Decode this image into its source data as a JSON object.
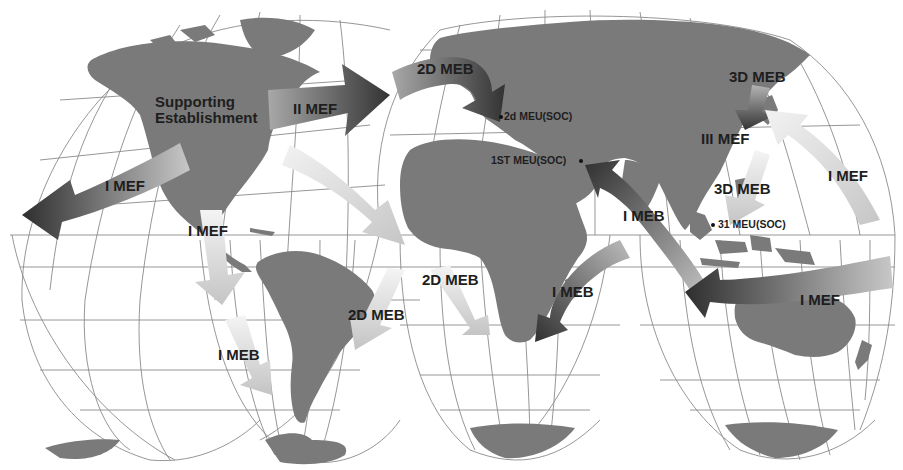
{
  "map": {
    "projection": "Goode homolosine (interrupted)",
    "colors": {
      "background": "#ffffff",
      "land": "#7a7a7a",
      "graticule": "#8a8a8a",
      "arrow_dark": "#3a3a3a",
      "arrow_mid": "#8c8c8c",
      "arrow_light": "#d8d8d8",
      "text": "#1e1e1e"
    },
    "labels": {
      "supporting_line1": "Supporting",
      "supporting_line2": "Establishment",
      "ii_mef": "II MEF",
      "i_mef_west": "I MEF",
      "i_mef_south": "I MEF",
      "i_meb_south": "I MEB",
      "twod_meb_north": "2D MEB",
      "twod_meb_atl_1": "2D MEB",
      "twod_meb_atl_2": "2D MEB",
      "twod_meu": "2d MEU(SOC)",
      "first_meu": "1ST MEU(SOC)",
      "threed_meb_north": "3D MEB",
      "iii_mef": "III MEF",
      "threed_meb_south": "3D MEB",
      "thirtyone_meu": "31 MEU(SOC)",
      "i_mef_pacific_north": "I MEF",
      "i_meb_indian": "I MEB",
      "i_meb_africa": "I MEB",
      "i_mef_pacific_south": "I MEF"
    }
  }
}
